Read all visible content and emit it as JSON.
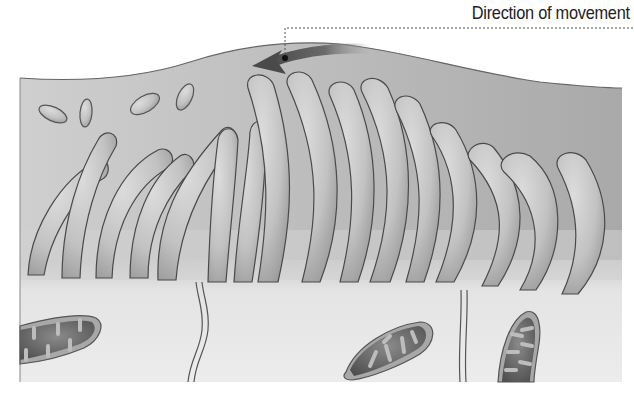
{
  "diagram": {
    "title_label": "Direction of movement",
    "elements": {
      "arrow": {
        "direction": "left",
        "color": "#5a5a5a"
      },
      "leader_line": {
        "style": "dotted",
        "color": "#555555"
      },
      "mucus_particles": 4,
      "cilia_count": 16,
      "mitochondria_count": 3,
      "cell_membranes": 2
    },
    "colors": {
      "background": "#ffffff",
      "fluid_layer": "#b9b9b9",
      "cilia_fill": "#c4c4c4",
      "cilia_outline": "#4a4a4a",
      "cytoplasm": "#e4e4e4",
      "mitochondria_inner": "#6a6a6a",
      "mitochondria_outer": "#a8a8a8"
    }
  }
}
